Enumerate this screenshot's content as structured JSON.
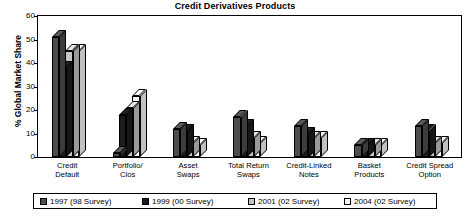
{
  "chart_data": {
    "type": "bar",
    "title": "Credit Derivatives Products",
    "xlabel": "",
    "ylabel": "% Global Market Share",
    "ylim": [
      0,
      60
    ],
    "yticks": [
      0,
      10,
      20,
      30,
      40,
      50,
      60
    ],
    "grid": false,
    "legend_position": "bottom",
    "style": "3d-clustered-column",
    "categories": [
      "Credit Default",
      "Portfolio/ Clos",
      "Asset Swaps",
      "Total Return Swaps",
      "Credit-Linked Notes",
      "Basket Products",
      "Credit Spread Option"
    ],
    "category_lines": [
      [
        "Credit",
        "Default"
      ],
      [
        "Portfolio/",
        "Clos"
      ],
      [
        "Asset",
        "Swaps"
      ],
      [
        "Total Return",
        "Swaps"
      ],
      [
        "Credit-Linked",
        "Notes"
      ],
      [
        "Basket",
        "Products"
      ],
      [
        "Credit Spread",
        "Option"
      ]
    ],
    "series": [
      {
        "name": "1997 (98 Survey)",
        "color": "#4d4d4d",
        "values": [
          51,
          1.5,
          12,
          17,
          13,
          5,
          13
        ]
      },
      {
        "name": "1999 (00 Survey)",
        "color": "#1c1c1c",
        "values": [
          38,
          18,
          11,
          13,
          10,
          5,
          11
        ]
      },
      {
        "name": "2001 (02 Survey)",
        "color": "#c4c4c4",
        "values": [
          45,
          21,
          6,
          8,
          8,
          5,
          6
        ]
      },
      {
        "name": "2004 (02 Survey)",
        "color": "#f7f7f7",
        "values": [
          45,
          26,
          5,
          6,
          8,
          5,
          6
        ]
      }
    ]
  }
}
